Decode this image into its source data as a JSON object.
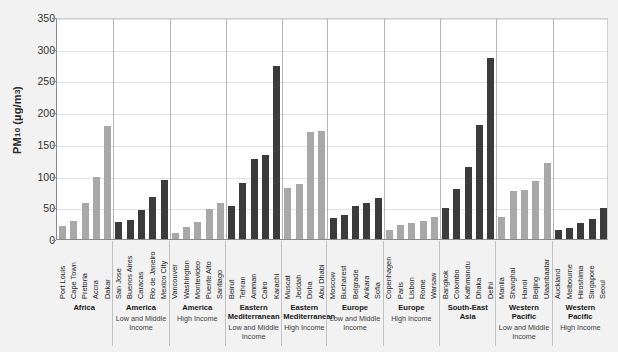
{
  "chart_data": {
    "type": "bar",
    "title": "",
    "xlabel": "",
    "ylabel": "PM10 (µg/m³)",
    "ylim": [
      0,
      350
    ],
    "yticks": [
      0,
      50,
      100,
      150,
      200,
      250,
      300,
      350
    ],
    "grid": true,
    "legend": "none",
    "colors": {
      "light_bar": "#a8a8a8",
      "dark_bar": "#3b3b3b",
      "plot_background": "#ffffff",
      "figure_background": "#f2f2f2",
      "gridline": "#e3e3e3",
      "axis": "#8a8a8a"
    },
    "categories": [
      "Port Louis",
      "Cape Town",
      "Pretoria",
      "Accra",
      "Dakar",
      "San Jose",
      "Buenos Aires",
      "Caracas",
      "Rio de Janeiro",
      "Mexico City",
      "Vancouver",
      "Washington",
      "Montevideo",
      "Puente Alto",
      "Santiago",
      "Beirut",
      "Tehran",
      "Amman",
      "Cairo",
      "Karachi",
      "Muscat",
      "Jeddah",
      "Doha",
      "Abu Dhabi",
      "Moscow",
      "Bucharest",
      "Belgrade",
      "Ankara",
      "Sofia",
      "Copenhagen",
      "Paris",
      "Lisbon",
      "Rome",
      "Warsaw",
      "Bangkok",
      "Colombo",
      "Kathmandu",
      "Dhaka",
      "Delhi",
      "Manila",
      "Shanghai",
      "Hanoi",
      "Beijing",
      "Ulaanbaatar",
      "Auckland",
      "Melbourne",
      "Hiroshima",
      "Singapore",
      "Seoul"
    ],
    "values": [
      20,
      28,
      56,
      97,
      178,
      27,
      30,
      45,
      67,
      93,
      10,
      19,
      27,
      47,
      56,
      52,
      88,
      126,
      133,
      273,
      80,
      87,
      168,
      170,
      33,
      38,
      52,
      56,
      64,
      14,
      22,
      26,
      29,
      35,
      49,
      79,
      114,
      180,
      286,
      34,
      76,
      78,
      92,
      120,
      14,
      17,
      26,
      32,
      49
    ],
    "bar_shades": [
      "light",
      "light",
      "light",
      "light",
      "light",
      "dark",
      "dark",
      "dark",
      "dark",
      "dark",
      "light",
      "light",
      "light",
      "light",
      "light",
      "dark",
      "dark",
      "dark",
      "dark",
      "dark",
      "light",
      "light",
      "light",
      "light",
      "dark",
      "dark",
      "dark",
      "dark",
      "dark",
      "light",
      "light",
      "light",
      "light",
      "light",
      "dark",
      "dark",
      "dark",
      "dark",
      "dark",
      "light",
      "light",
      "light",
      "light",
      "light",
      "dark",
      "dark",
      "dark",
      "dark",
      "dark"
    ],
    "groups": [
      {
        "region": "Africa",
        "income": "",
        "count": 5
      },
      {
        "region": "America",
        "income": "Low and Middle Income",
        "count": 5
      },
      {
        "region": "America",
        "income": "High Income",
        "count": 5
      },
      {
        "region": "Eastern Mediterranean",
        "income": "Low and Middle Income",
        "count": 5
      },
      {
        "region": "Eastern Mediterranean",
        "income": "High Income",
        "count": 4
      },
      {
        "region": "Europe",
        "income": "Low and Middle Income",
        "count": 5
      },
      {
        "region": "Europe",
        "income": "High Income",
        "count": 5
      },
      {
        "region": "South-East Asia",
        "income": "",
        "count": 5
      },
      {
        "region": "Western Pacific",
        "income": "Low and Middle Income",
        "count": 5
      },
      {
        "region": "Western Pacific",
        "income": "High Income",
        "count": 5
      }
    ]
  }
}
